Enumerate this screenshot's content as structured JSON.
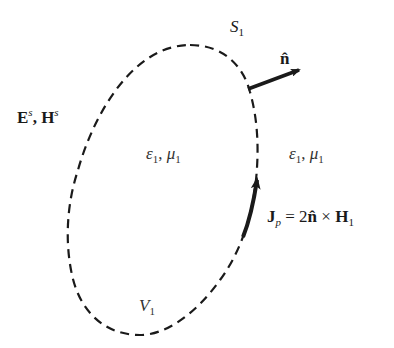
{
  "diagram": {
    "surface_label": {
      "base": "S",
      "sub": "1"
    },
    "normal_label": "n̂",
    "exterior_fields": {
      "e": "E",
      "e_sup": "s",
      "sep": ", ",
      "h": "H",
      "h_sup": "s"
    },
    "interior_medium": {
      "eps": "ε",
      "eps_sub": "1",
      "sep": ", ",
      "mu": "μ",
      "mu_sub": "1"
    },
    "exterior_medium": {
      "eps": "ε",
      "eps_sub": "1",
      "sep": ", ",
      "mu": "μ",
      "mu_sub": "1"
    },
    "current_label": {
      "j": "J",
      "j_sub": "p",
      "eq": " = 2",
      "n": "n̂",
      "cross": " × ",
      "h": "H",
      "h_sub": "1"
    },
    "volume_label": {
      "base": "V",
      "sub": "1"
    },
    "colors": {
      "stroke": "#1a1a1a",
      "background": "#ffffff"
    }
  }
}
